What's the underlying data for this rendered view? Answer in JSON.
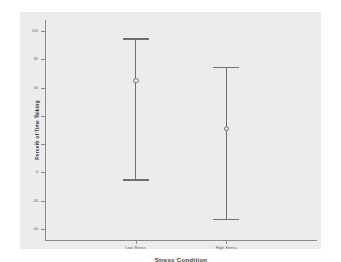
{
  "chart_data": {
    "type": "bar",
    "chart_style": "error-bar",
    "title": "",
    "xlabel": "Stress Condition",
    "ylabel": "Percent of Time Talking",
    "categories": [
      "Low Stress",
      "High Stress"
    ],
    "yticks": [
      100,
      80,
      60,
      40,
      20,
      0,
      -20,
      -40
    ],
    "ytick_labels": [
      "100",
      "80",
      "60",
      "40",
      "20",
      "0",
      "-20",
      "-40"
    ],
    "ylim": [
      -48,
      108
    ],
    "grid": false,
    "legend": false,
    "series": [
      {
        "name": "Mean with 95% CI",
        "values": [
          65,
          31
        ],
        "upper": [
          95,
          75
        ],
        "lower": [
          -5,
          -33
        ]
      }
    ],
    "points": [
      {
        "category": "Low Stress",
        "mean": 65,
        "ci_upper": 95,
        "ci_lower": -5
      },
      {
        "category": "High Stress",
        "mean": 31,
        "ci_upper": 75,
        "ci_lower": -33
      }
    ],
    "colors": {
      "background": "#ffffff",
      "plot_area": "#ececeb",
      "axis": "#8a8a8a",
      "error_bar": "#6f6f72",
      "tick_label": "#55555a",
      "axis_title": "#3c3c40"
    }
  }
}
